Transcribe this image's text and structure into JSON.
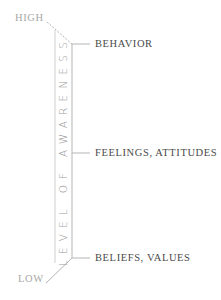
{
  "diagram": {
    "axis_label": "LEVEL OF AWARENESS",
    "top_label": "HIGH",
    "bottom_label": "LOW",
    "levels": [
      {
        "label": "BEHAVIOR"
      },
      {
        "label": "FEELINGS, ATTITUDES"
      },
      {
        "label": "BELIEFS, VALUES"
      }
    ],
    "colors": {
      "line": "#b5b5b5",
      "label_text": "#4a4a4a",
      "end_text": "#a8a8a8",
      "axis_text": "#9a9a9a"
    }
  }
}
